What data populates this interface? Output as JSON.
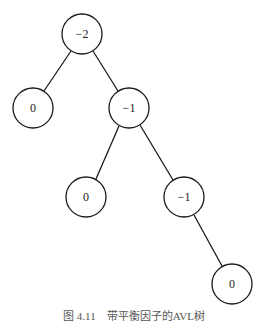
{
  "diagram": {
    "type": "binary-tree",
    "nodes": [
      {
        "id": "n1",
        "label": "−2",
        "x": 82,
        "y": 34
      },
      {
        "id": "n2",
        "label": "0",
        "x": 33,
        "y": 108
      },
      {
        "id": "n3",
        "label": "−1",
        "x": 129,
        "y": 108
      },
      {
        "id": "n4",
        "label": "0",
        "x": 86,
        "y": 197
      },
      {
        "id": "n5",
        "label": "−1",
        "x": 184,
        "y": 197
      },
      {
        "id": "n6",
        "label": "0",
        "x": 232,
        "y": 284
      }
    ],
    "edges": [
      {
        "from": "n1",
        "to": "n2"
      },
      {
        "from": "n1",
        "to": "n3"
      },
      {
        "from": "n3",
        "to": "n4"
      },
      {
        "from": "n3",
        "to": "n5"
      },
      {
        "from": "n5",
        "to": "n6"
      }
    ],
    "node_radius": 20
  },
  "caption": "图 4.11　带平衡因子的AVL树"
}
